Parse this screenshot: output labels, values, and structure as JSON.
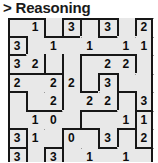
{
  "header": {
    "prompt_symbol": ">",
    "title": "Reasoning",
    "full_label": "> Reasoning"
  },
  "puzzle": {
    "type": "slitherlink",
    "columns": 8,
    "rows": 8,
    "background_color": "#e8e8e8",
    "line_color": "#171717",
    "dot_color": "#9a9a9a",
    "text_color": "#0d0d0d",
    "clue_rows": [
      [
        "",
        "1",
        "",
        "3",
        "",
        "3",
        "",
        "2"
      ],
      [
        "3",
        "",
        "1",
        "",
        "1",
        "",
        "1",
        "1"
      ],
      [
        "3",
        "2",
        "",
        "",
        "",
        "2",
        "2",
        ""
      ],
      [
        "2",
        "",
        "2",
        "2",
        "",
        "3",
        "",
        ""
      ],
      [
        "",
        "",
        "2",
        "",
        "2",
        "2",
        "",
        "3"
      ],
      [
        "",
        "1",
        "0",
        "",
        "",
        "",
        "1",
        "1"
      ],
      [
        "3",
        "1",
        "",
        "0",
        "",
        "3",
        "",
        "2"
      ],
      [
        "3",
        "",
        "3",
        "",
        "1",
        "",
        "1",
        ""
      ]
    ]
  }
}
